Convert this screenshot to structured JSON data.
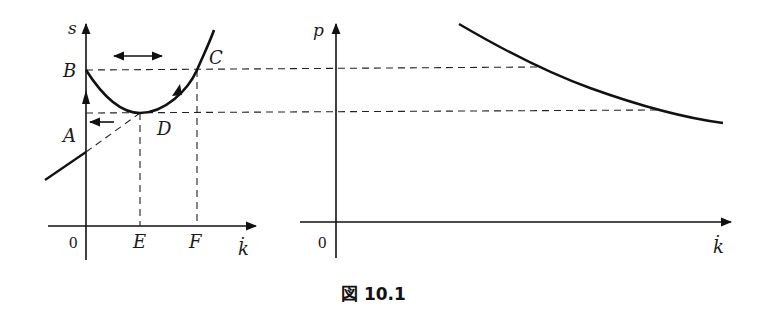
{
  "figure": {
    "caption": "図 10.1",
    "colors": {
      "ink": "#111111",
      "background": "#ffffff"
    }
  },
  "left_panel": {
    "y_axis_label": "s",
    "x_axis_label": "k̇",
    "origin_label": "0",
    "point_labels": {
      "A": "A",
      "B": "B",
      "C": "C",
      "D": "D",
      "E": "E",
      "F": "F"
    },
    "elements": [
      "U-shaped curve starting at B on s-axis, minimum at D, rising through C",
      "dashed horizontal at level of B/C extending to right panel",
      "dashed horizontal at level of D extending to right panel",
      "dashed verticals from D down to E and from C down to F",
      "straight line through A: solid left of s-axis, dashed from s-axis to tangent point D",
      "double-headed horizontal arrow above curve",
      "upward arrow on s-axis between A and B",
      "left-pointing arrow at level of D near s-axis",
      "direction arrowhead on curve between C and D pointing downward"
    ]
  },
  "right_panel": {
    "y_axis_label": "p",
    "x_axis_label": "k̇",
    "origin_label": "0",
    "elements": [
      "downward-sloping convex curve",
      "dashed lines from left panel (levels B and D) meet the curve"
    ]
  }
}
